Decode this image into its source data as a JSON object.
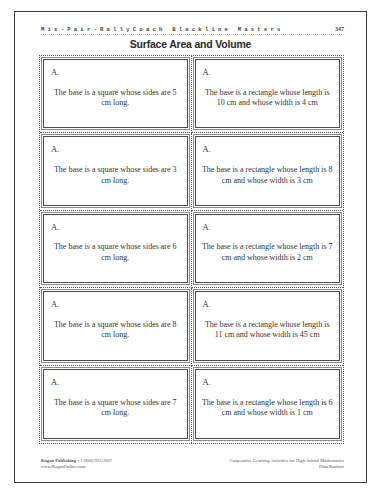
{
  "header": {
    "series": "Mix-Pair-RallyCoach Blackline Masters",
    "page_number": "347"
  },
  "title": "Surface Area and Volume",
  "cards": [
    {
      "label": "A.",
      "text": "The base is a square whose sides are 5 cm long."
    },
    {
      "label": "A.",
      "text": "The base is a rectangle whose length is 10 cm and whose width is 4 cm"
    },
    {
      "label": "A.",
      "text": "The base is a square whose sides are 3 cm long."
    },
    {
      "label": "A.",
      "text": "The base is a rectangle whose length is 8 cm and whose width is 3 cm"
    },
    {
      "label": "A.",
      "text": "The base is a square whose sides are 6 cm long."
    },
    {
      "label": "A.",
      "text": "The base is a rectangle whose length is 7 cm and whose width is 2 cm"
    },
    {
      "label": "A.",
      "text": "The base is a square whose sides are 8 cm long."
    },
    {
      "label": "A.",
      "text": "The base is a rectangle whose length is 11 cm and whose width is 45 cm"
    },
    {
      "label": "A.",
      "text": "The base is a square whose sides are 7 cm long."
    },
    {
      "label": "A.",
      "text": "The base is a rectangle whose length is 6 cm and whose width is 1 cm"
    }
  ],
  "footer": {
    "publisher": "Kagan Publishing",
    "phone": " • 1 (800) 933-2667",
    "website": "www.KaganOnline.com",
    "book_title": "Cooperative Learning Activities for High School Mathematics",
    "author": "Dina Kushnir"
  }
}
